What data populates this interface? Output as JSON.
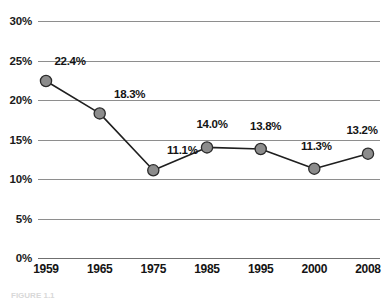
{
  "chart_data": {
    "type": "line",
    "title": "",
    "xlabel": "",
    "ylabel": "",
    "categories": [
      "1959",
      "1965",
      "1975",
      "1985",
      "1995",
      "2000",
      "2008"
    ],
    "values": [
      22.4,
      18.3,
      11.1,
      14.0,
      13.8,
      11.3,
      13.2
    ],
    "point_labels": [
      "22.4%",
      "18.3%",
      "11.1%",
      "14.0%",
      "13.8%",
      "11.3%",
      "13.2%"
    ],
    "ylim": [
      0,
      30
    ],
    "ytick_values": [
      30,
      25,
      20,
      15,
      10,
      5,
      0
    ],
    "ytick_labels": [
      "30%",
      "25%",
      "20%",
      "15%",
      "10%",
      "5%",
      "0%"
    ],
    "grid": true,
    "legend": "none",
    "series": [
      {
        "name": "",
        "values": [
          22.4,
          18.3,
          11.1,
          14.0,
          13.8,
          11.3,
          13.2
        ],
        "marker": "circle",
        "marker_fill": "#8c8c8c",
        "marker_stroke": "#2b2b2b",
        "line_color": "#1f1f1f"
      }
    ],
    "colors": {
      "background": "#ffffff",
      "gridline": "#8e8e8e",
      "axis": "#6f6f6f",
      "text": "#141414",
      "marker_fill": "#8c8c8c",
      "marker_stroke": "#2b2b2b",
      "line": "#1f1f1f"
    }
  },
  "caption": {
    "text": "FIGURE 1.1"
  }
}
